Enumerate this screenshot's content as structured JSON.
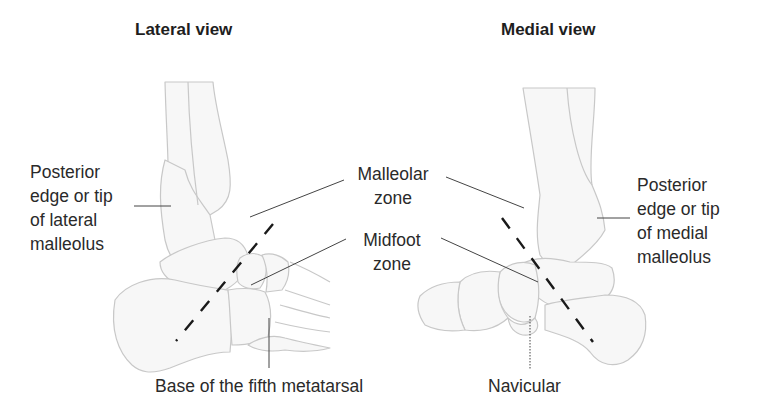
{
  "figure": {
    "lateral": {
      "title": "Lateral view",
      "posterior_label": [
        "Posterior",
        "edge or tip",
        "of lateral",
        "malleolus"
      ],
      "bottom_label": "Base of the fifth metatarsal"
    },
    "medial": {
      "title": "Medial view",
      "posterior_label": [
        "Posterior",
        "edge or tip",
        "of medial",
        "malleolus"
      ],
      "bottom_label": "Navicular"
    },
    "zones": {
      "malleolar": [
        "Malleolar",
        "zone"
      ],
      "midfoot": [
        "Midfoot",
        "zone"
      ]
    },
    "colors": {
      "bone_outline": "#c9c9c9",
      "bone_fill": "#f6f6f6",
      "leader_line": "#444444",
      "dashed_line": "#1a1a1a",
      "text": "#2a2a2a"
    }
  }
}
